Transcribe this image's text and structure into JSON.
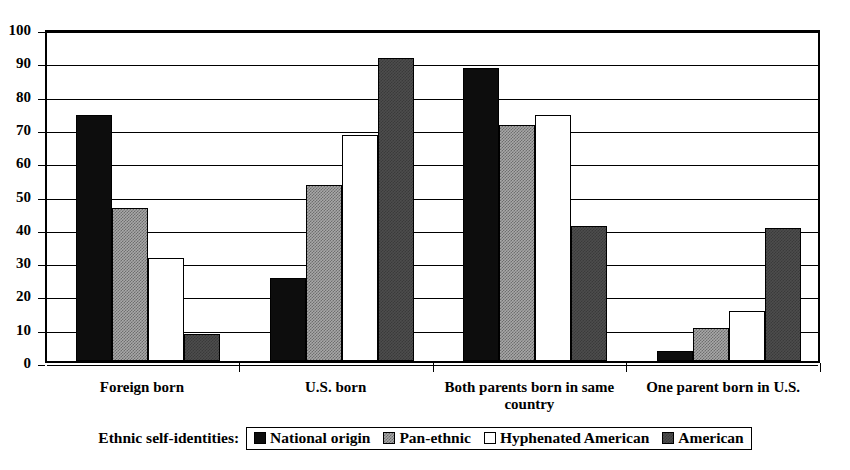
{
  "chart_data": {
    "type": "bar",
    "title": "",
    "xlabel": "",
    "ylabel": "",
    "ylim": [
      0,
      100
    ],
    "ytick_step": 10,
    "grid": true,
    "legend_position": "bottom",
    "legend_title": "Ethnic self-identities:",
    "categories": [
      "Foreign born",
      "U.S. born",
      "Both parents born in same\ncountry",
      "One parent born in U.S."
    ],
    "yticks": [
      "0",
      "10",
      "20",
      "30",
      "40",
      "50",
      "60",
      "70",
      "80",
      "90",
      "100"
    ],
    "series": [
      {
        "name": "National origin",
        "fill": "solid-black",
        "color": "#0d0d0d",
        "values": [
          74,
          25,
          88,
          3
        ]
      },
      {
        "name": "Pan-ethnic",
        "fill": "light-dither",
        "color": "#a8a8a8",
        "values": [
          46,
          53,
          71,
          10
        ]
      },
      {
        "name": "Hyphenated American",
        "fill": "white",
        "color": "#ffffff",
        "values": [
          31,
          68,
          74,
          15
        ]
      },
      {
        "name": "American",
        "fill": "dark-dither",
        "color": "#4d4d4d",
        "values": [
          8,
          91,
          40.5,
          40
        ]
      }
    ]
  }
}
